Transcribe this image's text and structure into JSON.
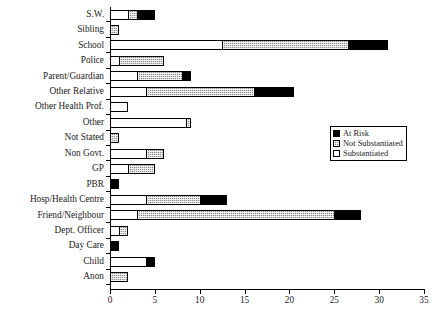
{
  "chart_data": {
    "type": "bar",
    "orientation": "horizontal",
    "stacked": true,
    "title": "",
    "xlabel": "",
    "ylabel": "",
    "xlim": [
      0,
      35
    ],
    "xticks": [
      0,
      5,
      10,
      15,
      20,
      25,
      30,
      35
    ],
    "grid": false,
    "legend_position": "right-middle",
    "categories": [
      "S.W.",
      "Sibling",
      "School",
      "Police",
      "Parent/Guardian",
      "Other Relative",
      "Other Health Prof.",
      "Other",
      "Not Stated",
      "Non Govt.",
      "GP",
      "PBR",
      "Hosp/Health Centre",
      "Friend/Neighbour",
      "Dept. Officer",
      "Day Care",
      "Child",
      "Anon"
    ],
    "series": [
      {
        "name": "Substantiated",
        "color": "#ffffff",
        "pattern": "solid-white",
        "values": [
          2,
          0,
          12.5,
          1,
          3,
          4,
          2,
          8.5,
          0,
          4,
          2,
          0,
          4,
          3,
          1,
          0,
          4,
          0
        ]
      },
      {
        "name": "Not Substantiated",
        "color": "#8a8a8a",
        "pattern": "stippled-grey",
        "values": [
          1,
          1,
          14,
          5,
          5,
          12,
          0,
          0.5,
          1,
          2,
          3,
          0,
          6,
          22,
          1,
          0,
          0,
          2
        ]
      },
      {
        "name": "At Risk",
        "color": "#000000",
        "pattern": "solid-black",
        "values": [
          2,
          0,
          4.5,
          0,
          1,
          4.5,
          0,
          0,
          0,
          0,
          0,
          1,
          3,
          3,
          0,
          1,
          1,
          0
        ]
      }
    ],
    "totals": [
      5,
      1,
      31,
      6,
      9,
      20.5,
      2,
      9,
      1,
      6,
      5,
      1,
      13,
      28,
      2,
      1,
      5,
      2
    ],
    "legend_entries": [
      "At Risk",
      "Not Substantiated",
      "Substantiated"
    ]
  }
}
